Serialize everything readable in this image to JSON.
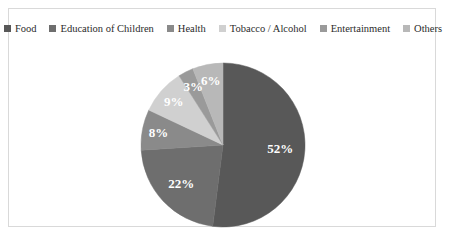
{
  "chart_data": {
    "type": "pie",
    "title": "",
    "subtitle": "",
    "xlabel": "",
    "ylabel": "",
    "grid": false,
    "legend_position": "top",
    "unit": "%",
    "categories": [
      "Food",
      "Education of Children",
      "Health",
      "Tobacco / Alcohol",
      "Entertainment",
      "Others"
    ],
    "values": [
      52,
      22,
      8,
      9,
      3,
      6
    ],
    "data_labels": [
      "52%",
      "22%",
      "8%",
      "9%",
      "3%",
      "6%"
    ],
    "colors": [
      "#585858",
      "#6e6e6e",
      "#8a8a8a",
      "#d0d0d0",
      "#9a9a9a",
      "#b8b8b8"
    ],
    "slices": [
      {
        "label": "Food",
        "value": 52,
        "data_label": "52%",
        "color": "#585858"
      },
      {
        "label": "Education of Children",
        "value": 22,
        "data_label": "22%",
        "color": "#6e6e6e"
      },
      {
        "label": "Health",
        "value": 8,
        "data_label": "8%",
        "color": "#8a8a8a"
      },
      {
        "label": "Tobacco / Alcohol",
        "value": 9,
        "data_label": "9%",
        "color": "#d0d0d0"
      },
      {
        "label": "Entertainment",
        "value": 3,
        "data_label": "3%",
        "color": "#9a9a9a"
      },
      {
        "label": "Others",
        "value": 6,
        "data_label": "6%",
        "color": "#b8b8b8"
      }
    ]
  },
  "legend": {
    "items": [
      {
        "label": "Food",
        "color": "#585858"
      },
      {
        "label": "Education of Children",
        "color": "#6e6e6e"
      },
      {
        "label": "Health",
        "color": "#8a8a8a"
      },
      {
        "label": "Tobacco / Alcohol",
        "color": "#d0d0d0"
      },
      {
        "label": "Entertainment",
        "color": "#9a9a9a"
      },
      {
        "label": "Others",
        "color": "#b8b8b8"
      }
    ]
  },
  "frame": {
    "border_color": "#d9d9d9",
    "background": "#ffffff"
  }
}
